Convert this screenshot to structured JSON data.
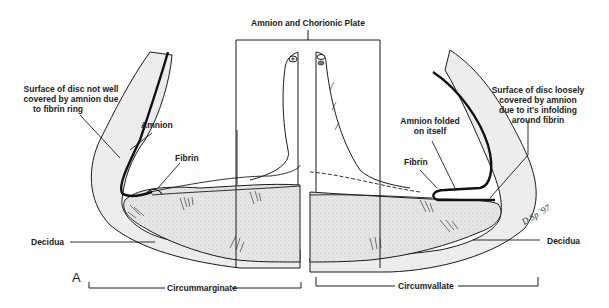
{
  "figure": {
    "panel_letter": "A",
    "top_label": "Amnion and Chorionic Plate",
    "left": {
      "surface_label_lines": [
        "Surface of disc not well",
        "covered by amnion due",
        "to fibrin ring"
      ],
      "amnion_label": "Amnion",
      "fibrin_label": "Fibrin",
      "decidua_label": "Decidua",
      "bracket_label": "Circummarginate"
    },
    "right": {
      "surface_label_lines": [
        "Surface of disc loosely",
        "covered by amnion",
        "due to it's infolding",
        "around fibrin"
      ],
      "amnion_folded_label_lines": [
        "Amnion folded",
        "on itself"
      ],
      "fibrin_label": "Fibrin",
      "decidua_label": "Decidua",
      "bracket_label": "Circumvallate"
    },
    "signature": "D Sp. '97"
  },
  "colors": {
    "ink": "#1a1a1a",
    "decidua_fill": "#ececec",
    "placenta_fill": "#dcdcdc",
    "background": "#ffffff"
  }
}
